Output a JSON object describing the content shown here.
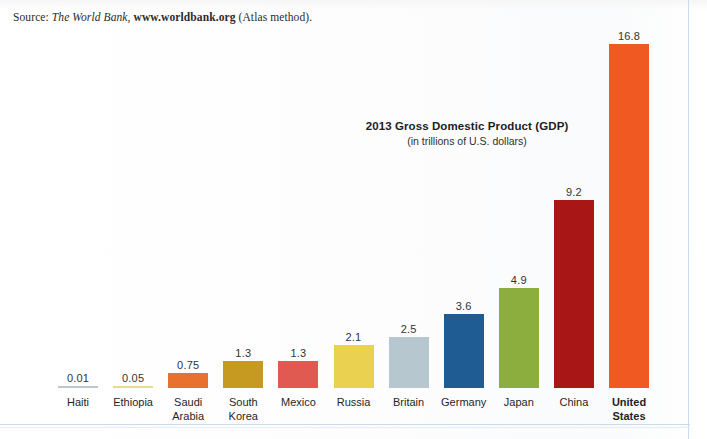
{
  "source": {
    "prefix": "Source:",
    "publication": "The World Bank,",
    "url": "www.worldbank.org",
    "suffix": "(Atlas method)."
  },
  "chart_data": {
    "type": "bar",
    "title": "2013 Gross Domestic Product (GDP)",
    "subtitle": "(in trillions of U.S. dollars)",
    "xlabel": "",
    "ylabel": "",
    "ylim": [
      0,
      16.8
    ],
    "grid": false,
    "legend": "none",
    "units": "trillions of U.S. dollars",
    "categories": [
      "Haiti",
      "Ethiopia",
      "Saudi Arabia",
      "South Korea",
      "Mexico",
      "Russia",
      "Britain",
      "Germany",
      "Japan",
      "China",
      "United States"
    ],
    "values": [
      0.01,
      0.05,
      0.75,
      1.3,
      1.3,
      2.1,
      2.5,
      3.6,
      4.9,
      9.2,
      16.8
    ],
    "value_labels": [
      "0.01",
      "0.05",
      "0.75",
      "1.3",
      "1.3",
      "2.1",
      "2.5",
      "3.6",
      "4.9",
      "9.2",
      "16.8"
    ],
    "bar_colors": [
      "#b9c8d2",
      "#ead98e",
      "#e8712e",
      "#c69a20",
      "#e05a52",
      "#ead250",
      "#b6c7d0",
      "#1f5c93",
      "#8cae3e",
      "#a81616",
      "#f05a22"
    ],
    "label_lines": [
      [
        "Haiti"
      ],
      [
        "Ethiopia"
      ],
      [
        "Saudi",
        "Arabia"
      ],
      [
        "South",
        "Korea"
      ],
      [
        "Mexico"
      ],
      [
        "Russia"
      ],
      [
        "Britain"
      ],
      [
        "Germany"
      ],
      [
        "Japan"
      ],
      [
        "China"
      ],
      [
        "United",
        "States"
      ]
    ],
    "highlight_category": "United States"
  },
  "colors": {
    "value_label": "#333333",
    "axis_label": "#1f1f1f",
    "page_rule": "#c9dced"
  }
}
